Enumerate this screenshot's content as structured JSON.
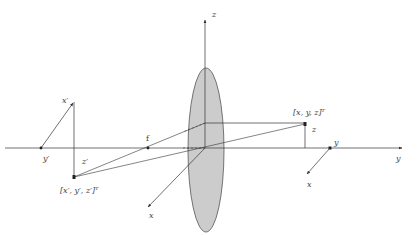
{
  "diagram": {
    "type": "thin-lens-projection",
    "colors": {
      "line": "#333333",
      "lens_fill": "#cccccc",
      "lens_stroke": "#555555",
      "label": "#444444"
    },
    "labels": {
      "z_axis": "z",
      "y_axis": "y",
      "x_axis": "x",
      "focal": "f",
      "object_point": "[x, y, z]ᵀ",
      "object_z": "z",
      "object_y": "y",
      "object_x": "x",
      "image_point": "[x′, y′, z′]ᵀ",
      "image_x": "x′",
      "image_y": "y′",
      "image_z": "z′"
    }
  }
}
